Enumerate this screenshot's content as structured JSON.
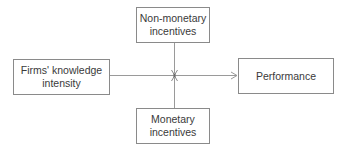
{
  "diagram": {
    "type": "moderation-model",
    "nodes": {
      "top": {
        "id": "non-monetary-incentives",
        "lines": [
          "Non-monetary",
          "incentives"
        ]
      },
      "left": {
        "id": "firms-knowledge-intensity",
        "lines": [
          "Firms' knowledge",
          "intensity"
        ]
      },
      "right": {
        "id": "performance",
        "lines": [
          "Performance"
        ]
      },
      "bottom": {
        "id": "monetary-incentives",
        "lines": [
          "Monetary",
          "incentives"
        ]
      }
    },
    "edges": [
      {
        "from": "firms-knowledge-intensity",
        "to": "performance",
        "kind": "direct-arrow"
      },
      {
        "from": "non-monetary-incentives",
        "to": "firms-knowledge-intensity->performance",
        "kind": "moderator-arrow"
      },
      {
        "from": "monetary-incentives",
        "to": "firms-knowledge-intensity->performance",
        "kind": "moderator-arrow"
      }
    ],
    "colors": {
      "line": "#9a9a9a",
      "border": "#8a8a8a",
      "text": "#3a3a3a",
      "background": "#ffffff"
    }
  }
}
